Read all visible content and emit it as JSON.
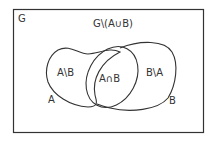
{
  "diagram": {
    "universe_label": "G",
    "complement_label": "G\\(A∪B)",
    "regions": {
      "a_minus_b": "A\\B",
      "intersection": "A∩B",
      "b_minus_a": "B\\A"
    },
    "set_labels": {
      "a": "A",
      "b": "B"
    },
    "colors": {
      "stroke": "#333333",
      "background": "#ffffff"
    }
  }
}
